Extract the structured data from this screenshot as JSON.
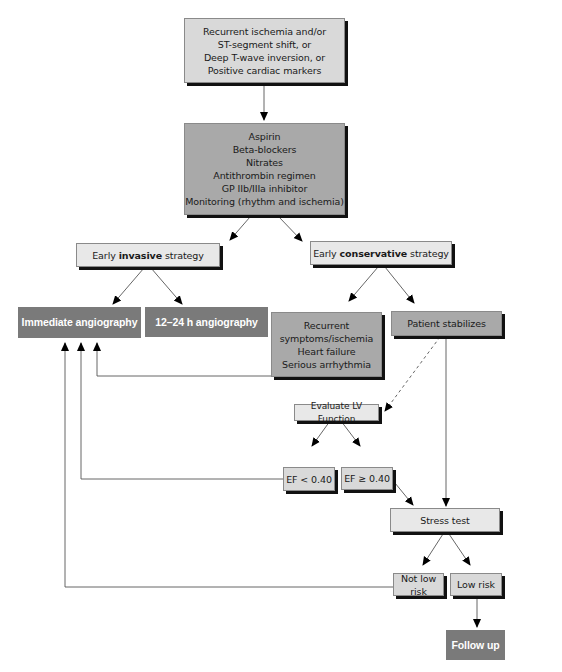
{
  "diagram": {
    "type": "flowchart",
    "nodes": {
      "entry": {
        "lines": [
          "Recurrent ischemia and/or",
          "ST-segment shift, or",
          "Deep T-wave inversion, or",
          "Positive cardiac markers"
        ]
      },
      "treatment": {
        "lines": [
          "Aspirin",
          "Beta-blockers",
          "Nitrates",
          "Antithrombin regimen",
          "GP IIb/IIIa inhibitor",
          "Monitoring (rhythm and ischemia)"
        ]
      },
      "invasive": {
        "prefix": "Early ",
        "bold": "invasive",
        "suffix": " strategy"
      },
      "conservative": {
        "prefix": "Early ",
        "bold": "conservative",
        "suffix": " strategy"
      },
      "immediate_angio": {
        "label": "Immediate angiography"
      },
      "delayed_angio": {
        "label": "12–24 h angiography"
      },
      "recurrent": {
        "lines": [
          "Recurrent",
          "symptoms/ischemia",
          "Heart failure",
          "Serious arrhythmia"
        ]
      },
      "stabilizes": {
        "label": "Patient stabilizes"
      },
      "evaluate_lv": {
        "label": "Evaluate LV Function"
      },
      "ef_low": {
        "label": "EF < 0.40"
      },
      "ef_high": {
        "label": "EF ≥ 0.40"
      },
      "stress_test": {
        "label": "Stress test"
      },
      "not_low_risk": {
        "label": "Not low risk"
      },
      "low_risk": {
        "label": "Low risk"
      },
      "follow_up": {
        "label": "Follow up"
      }
    },
    "edges": [
      {
        "from": "entry",
        "to": "treatment",
        "style": "solid"
      },
      {
        "from": "treatment",
        "to": "invasive",
        "style": "solid"
      },
      {
        "from": "treatment",
        "to": "conservative",
        "style": "solid"
      },
      {
        "from": "invasive",
        "to": "immediate_angio",
        "style": "solid"
      },
      {
        "from": "invasive",
        "to": "delayed_angio",
        "style": "solid"
      },
      {
        "from": "conservative",
        "to": "recurrent",
        "style": "solid"
      },
      {
        "from": "conservative",
        "to": "stabilizes",
        "style": "solid"
      },
      {
        "from": "recurrent",
        "to": "immediate_angio",
        "style": "solid"
      },
      {
        "from": "stabilizes",
        "to": "evaluate_lv",
        "style": "dashed"
      },
      {
        "from": "stabilizes",
        "to": "stress_test",
        "style": "solid"
      },
      {
        "from": "evaluate_lv",
        "to": "ef_low",
        "style": "solid"
      },
      {
        "from": "evaluate_lv",
        "to": "ef_high",
        "style": "solid"
      },
      {
        "from": "ef_low",
        "to": "immediate_angio",
        "style": "solid"
      },
      {
        "from": "ef_high",
        "to": "stress_test",
        "style": "solid"
      },
      {
        "from": "stress_test",
        "to": "not_low_risk",
        "style": "solid"
      },
      {
        "from": "stress_test",
        "to": "low_risk",
        "style": "solid"
      },
      {
        "from": "not_low_risk",
        "to": "immediate_angio",
        "style": "solid"
      },
      {
        "from": "low_risk",
        "to": "follow_up",
        "style": "solid"
      }
    ],
    "colors": {
      "light_box": "#d9d9d9",
      "lighter_box": "#e8e8e8",
      "medium_box": "#a9a9a9",
      "dark_box": "#7a7a7a",
      "shadow": "#111111",
      "line": "#555555"
    }
  }
}
